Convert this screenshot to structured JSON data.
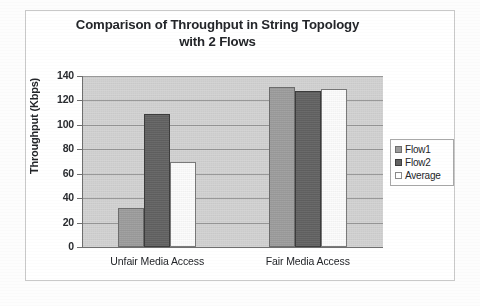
{
  "figure": {
    "title_line1": "Comparison of Throughput in String Topology",
    "title_line2": "with 2 Flows"
  },
  "chart_data": {
    "type": "bar",
    "title": "Comparison of Throughput in String Topology with 2 Flows",
    "xlabel": "",
    "ylabel": "Throughput (Kbps)",
    "categories": [
      "Unfair Media Access",
      "Fair Media Access"
    ],
    "series": [
      {
        "name": "Flow1",
        "values": [
          32,
          131
        ],
        "color": "#9c9c9c"
      },
      {
        "name": "Flow2",
        "values": [
          109,
          128
        ],
        "color": "#636363"
      },
      {
        "name": "Average",
        "values": [
          70,
          129
        ],
        "color": "#ffffff"
      }
    ],
    "ylim": [
      0,
      140
    ],
    "ytick_step": 20,
    "yticks": [
      "140",
      "120",
      "100",
      "80",
      "60",
      "40",
      "20",
      "0"
    ],
    "grid": true,
    "legend_position": "right",
    "plot_background": "#d4d4d4"
  }
}
